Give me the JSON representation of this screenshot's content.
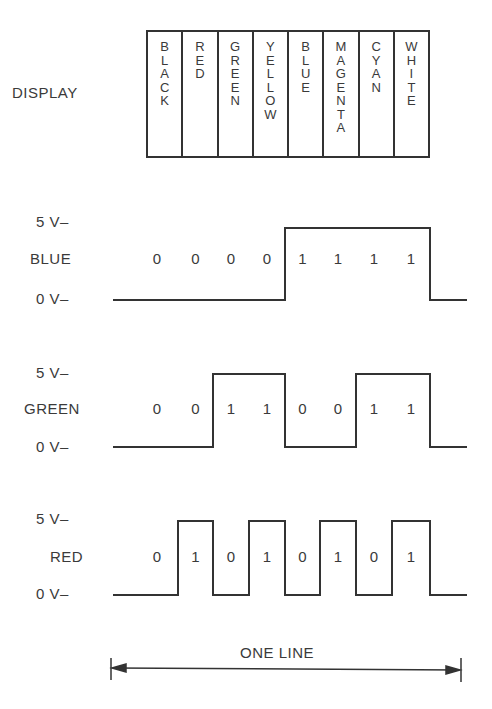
{
  "caption_fragment": "",
  "display": {
    "label": "DISPLAY",
    "columns": [
      "BLACK",
      "RED",
      "GREEN",
      "YELLOW",
      "BLUE",
      "MAGENTA",
      "CYAN",
      "WHITE"
    ]
  },
  "levels": {
    "high": "5 V–",
    "low": "0 V–"
  },
  "signals": [
    {
      "name": "BLUE",
      "bits": [
        "0",
        "0",
        "0",
        "0",
        "1",
        "1",
        "1",
        "1"
      ]
    },
    {
      "name": "GREEN",
      "bits": [
        "0",
        "0",
        "1",
        "1",
        "0",
        "0",
        "1",
        "1"
      ]
    },
    {
      "name": "RED",
      "bits": [
        "0",
        "1",
        "0",
        "1",
        "0",
        "1",
        "0",
        "1"
      ]
    }
  ],
  "span": {
    "label": "ONE LINE"
  },
  "colors": {
    "ink": "#333333",
    "text": "#3a3a3a",
    "background": "#ffffff"
  }
}
